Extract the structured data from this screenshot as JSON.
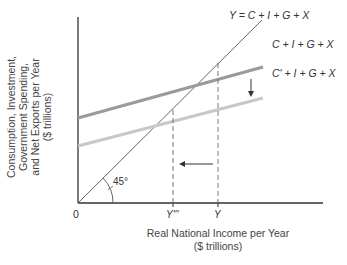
{
  "diagram": {
    "y_axis_label": [
      "Consumption, Investment,",
      "Government Spending,",
      "and Net Exports per Year",
      "($ trillions)"
    ],
    "x_axis_label": [
      "Real National Income per Year",
      "($ trillions)"
    ],
    "origin_label": "0",
    "angle_label": "45°",
    "curves": {
      "forty_five": "Y = C + I + G + X",
      "ae_original": "C + I + G + X",
      "ae_shifted": "C' + I + G + X"
    },
    "tick_labels": {
      "y_new": "Y'''",
      "y_orig": "Y"
    },
    "colors": {
      "axis": "#333333",
      "forty_five_line": "#555555",
      "ae_original": "#9a9a9a",
      "ae_shifted": "#c8c8c8",
      "dashed": "#666666"
    }
  }
}
